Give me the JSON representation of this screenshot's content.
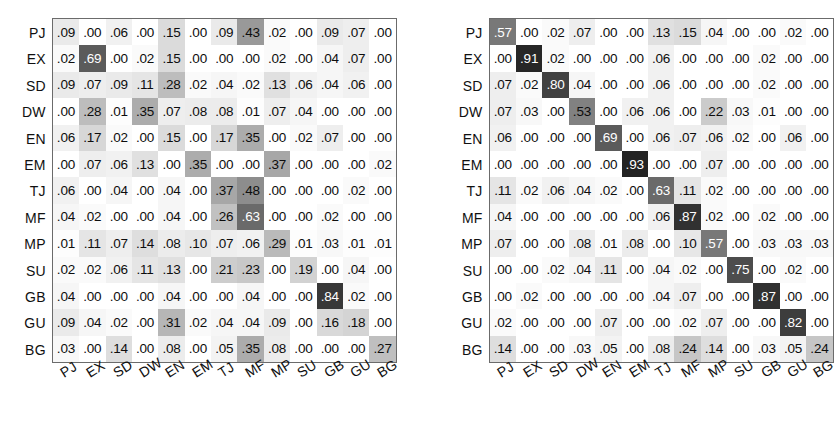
{
  "figure": {
    "type": "confusion-matrix-pair",
    "background_color": "#ffffff",
    "text_color": "#0d0d0d",
    "dark_cell_text_color": "#ffffff",
    "border_color": "#6b6b6b"
  },
  "labels": [
    "PJ",
    "EX",
    "SD",
    "DW",
    "EN",
    "EM",
    "TJ",
    "MF",
    "MP",
    "SU",
    "GB",
    "GU",
    "BG"
  ],
  "chart_data": [
    {
      "type": "heatmap",
      "name": "left-confusion-matrix",
      "title": "",
      "xlabel": "",
      "ylabel": "",
      "grid": true,
      "legend": "none",
      "colormap": "grayscale-reversed",
      "vmin": 0.0,
      "vmax": 1.0,
      "x_tick_labels": [
        "PJ",
        "EX",
        "SD",
        "DW",
        "EN",
        "EM",
        "TJ",
        "MF",
        "MP",
        "SU",
        "GB",
        "GU",
        "BG"
      ],
      "y_tick_labels": [
        "PJ",
        "EX",
        "SD",
        "DW",
        "EN",
        "EM",
        "TJ",
        "MF",
        "MP",
        "SU",
        "GB",
        "GU",
        "BG"
      ],
      "rows": [
        {
          "label": "PJ",
          "values": [
            ".09",
            ".00",
            ".06",
            ".00",
            ".15",
            ".00",
            ".09",
            ".43",
            ".02",
            ".00",
            ".09",
            ".07",
            ".00"
          ]
        },
        {
          "label": "EX",
          "values": [
            ".02",
            ".69",
            ".00",
            ".02",
            ".15",
            ".00",
            ".00",
            ".00",
            ".02",
            ".00",
            ".04",
            ".07",
            ".00"
          ]
        },
        {
          "label": "SD",
          "values": [
            ".09",
            ".07",
            ".09",
            ".11",
            ".28",
            ".02",
            ".04",
            ".02",
            ".13",
            ".06",
            ".04",
            ".06",
            ".00"
          ]
        },
        {
          "label": "DW",
          "values": [
            ".00",
            ".28",
            ".01",
            ".35",
            ".07",
            ".08",
            ".08",
            ".01",
            ".07",
            ".04",
            ".00",
            ".00",
            ".00"
          ]
        },
        {
          "label": "EN",
          "values": [
            ".06",
            ".17",
            ".02",
            ".00",
            ".15",
            ".00",
            ".17",
            ".35",
            ".00",
            ".02",
            ".07",
            ".00",
            ".00"
          ]
        },
        {
          "label": "EM",
          "values": [
            ".00",
            ".07",
            ".06",
            ".13",
            ".00",
            ".35",
            ".00",
            ".00",
            ".37",
            ".00",
            ".00",
            ".00",
            ".02"
          ]
        },
        {
          "label": "TJ",
          "values": [
            ".06",
            ".00",
            ".04",
            ".00",
            ".04",
            ".00",
            ".37",
            ".48",
            ".00",
            ".00",
            ".00",
            ".02",
            ".00"
          ]
        },
        {
          "label": "MF",
          "values": [
            ".04",
            ".02",
            ".00",
            ".00",
            ".04",
            ".00",
            ".26",
            ".63",
            ".00",
            ".00",
            ".02",
            ".00",
            ".00"
          ]
        },
        {
          "label": "MP",
          "values": [
            ".01",
            ".11",
            ".07",
            ".14",
            ".08",
            ".10",
            ".07",
            ".06",
            ".29",
            ".01",
            ".03",
            ".01",
            ".01"
          ]
        },
        {
          "label": "SU",
          "values": [
            ".02",
            ".02",
            ".06",
            ".11",
            ".13",
            ".00",
            ".21",
            ".23",
            ".00",
            ".19",
            ".00",
            ".04",
            ".00"
          ]
        },
        {
          "label": "GB",
          "values": [
            ".04",
            ".00",
            ".00",
            ".00",
            ".04",
            ".00",
            ".00",
            ".04",
            ".00",
            ".00",
            ".84",
            ".02",
            ".00"
          ]
        },
        {
          "label": "GU",
          "values": [
            ".09",
            ".04",
            ".02",
            ".00",
            ".31",
            ".02",
            ".04",
            ".04",
            ".09",
            ".00",
            ".16",
            ".18",
            ".00"
          ]
        },
        {
          "label": "BG",
          "values": [
            ".03",
            ".00",
            ".14",
            ".00",
            ".08",
            ".00",
            ".05",
            ".35",
            ".08",
            ".00",
            ".00",
            ".00",
            ".27"
          ]
        }
      ]
    },
    {
      "type": "heatmap",
      "name": "right-confusion-matrix",
      "title": "",
      "xlabel": "",
      "ylabel": "",
      "grid": true,
      "legend": "none",
      "colormap": "grayscale-reversed",
      "vmin": 0.0,
      "vmax": 1.0,
      "x_tick_labels": [
        "PJ",
        "EX",
        "SD",
        "DW",
        "EN",
        "EM",
        "TJ",
        "MF",
        "MP",
        "SU",
        "GB",
        "GU",
        "BG"
      ],
      "y_tick_labels": [
        "PJ",
        "EX",
        "SD",
        "DW",
        "EN",
        "EM",
        "TJ",
        "MF",
        "MP",
        "SU",
        "GB",
        "GU",
        "BG"
      ],
      "rows": [
        {
          "label": "PJ",
          "values": [
            ".57",
            ".00",
            ".02",
            ".07",
            ".00",
            ".00",
            ".13",
            ".15",
            ".04",
            ".00",
            ".00",
            ".02",
            ".00"
          ]
        },
        {
          "label": "EX",
          "values": [
            ".00",
            ".91",
            ".02",
            ".00",
            ".00",
            ".00",
            ".06",
            ".00",
            ".00",
            ".00",
            ".02",
            ".00",
            ".00"
          ]
        },
        {
          "label": "SD",
          "values": [
            ".07",
            ".02",
            ".80",
            ".04",
            ".00",
            ".00",
            ".06",
            ".00",
            ".00",
            ".00",
            ".02",
            ".00",
            ".00"
          ]
        },
        {
          "label": "DW",
          "values": [
            ".07",
            ".03",
            ".00",
            ".53",
            ".00",
            ".06",
            ".06",
            ".00",
            ".22",
            ".03",
            ".01",
            ".00",
            ".00"
          ]
        },
        {
          "label": "EN",
          "values": [
            ".06",
            ".00",
            ".00",
            ".00",
            ".69",
            ".00",
            ".06",
            ".07",
            ".06",
            ".02",
            ".00",
            ".06",
            ".00"
          ]
        },
        {
          "label": "EM",
          "values": [
            ".00",
            ".00",
            ".00",
            ".00",
            ".00",
            ".93",
            ".00",
            ".00",
            ".07",
            ".00",
            ".00",
            ".00",
            ".00"
          ]
        },
        {
          "label": "TJ",
          "values": [
            ".11",
            ".02",
            ".06",
            ".04",
            ".02",
            ".00",
            ".63",
            ".11",
            ".02",
            ".00",
            ".00",
            ".00",
            ".00"
          ]
        },
        {
          "label": "MF",
          "values": [
            ".04",
            ".00",
            ".00",
            ".00",
            ".00",
            ".00",
            ".06",
            ".87",
            ".02",
            ".00",
            ".02",
            ".00",
            ".00"
          ]
        },
        {
          "label": "MP",
          "values": [
            ".07",
            ".00",
            ".00",
            ".08",
            ".01",
            ".08",
            ".00",
            ".10",
            ".57",
            ".00",
            ".03",
            ".03",
            ".03"
          ]
        },
        {
          "label": "SU",
          "values": [
            ".00",
            ".00",
            ".02",
            ".04",
            ".11",
            ".00",
            ".04",
            ".02",
            ".00",
            ".75",
            ".00",
            ".02",
            ".00"
          ]
        },
        {
          "label": "GB",
          "values": [
            ".00",
            ".02",
            ".00",
            ".00",
            ".00",
            ".00",
            ".04",
            ".07",
            ".00",
            ".00",
            ".87",
            ".00",
            ".00"
          ]
        },
        {
          "label": "GU",
          "values": [
            ".02",
            ".00",
            ".00",
            ".00",
            ".07",
            ".00",
            ".00",
            ".02",
            ".07",
            ".00",
            ".00",
            ".82",
            ".00"
          ]
        },
        {
          "label": "BG",
          "values": [
            ".14",
            ".00",
            ".00",
            ".03",
            ".05",
            ".00",
            ".08",
            ".24",
            ".14",
            ".00",
            ".03",
            ".05",
            ".24"
          ]
        }
      ]
    }
  ]
}
